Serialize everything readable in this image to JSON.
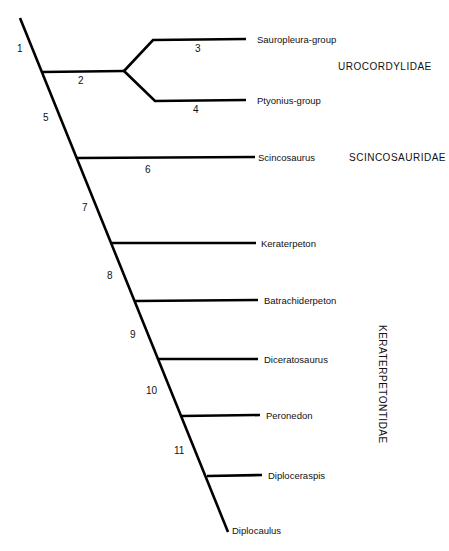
{
  "diagram": {
    "type": "cladogram",
    "taxa": [
      {
        "name": "Sauropleura-group"
      },
      {
        "name": "Ptyonius-group"
      },
      {
        "name": "Scincosaurus"
      },
      {
        "name": "Keraterpeton"
      },
      {
        "name": "Batrachiderpeton"
      },
      {
        "name": "Diceratosaurus"
      },
      {
        "name": "Peronedon"
      },
      {
        "name": "Diploceraspis"
      },
      {
        "name": "Diplocaulus"
      }
    ],
    "node_numbers": [
      "1",
      "2",
      "3",
      "4",
      "5",
      "6",
      "7",
      "8",
      "9",
      "10",
      "11"
    ],
    "families": [
      {
        "name": "UROCORDYLIDAE"
      },
      {
        "name": "SCINCOSAURIDAE"
      },
      {
        "name": "KERATERPETONTIDAE"
      }
    ]
  }
}
